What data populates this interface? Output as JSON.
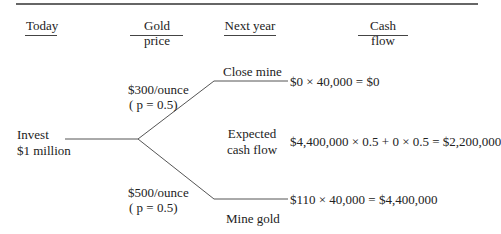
{
  "headers": {
    "today": "Today",
    "gold_price": "Gold price",
    "next_year": "Next year",
    "cash_flow": "Cash flow"
  },
  "root": {
    "line1": "Invest",
    "line2": "$1 million"
  },
  "branches": {
    "low": {
      "price": "$300/ounce",
      "prob": "( p = 0.5)",
      "decision": "Close mine",
      "cash_flow": "$0 × 40,000 = $0"
    },
    "high": {
      "price": "$500/ounce",
      "prob": "( p = 0.5)",
      "decision": "Mine gold",
      "cash_flow": "$110 × 40,000 = $4,400,000"
    }
  },
  "expected": {
    "line1": "Expected",
    "line2": "cash flow",
    "formula": "$4,400,000 × 0.5 + 0 × 0.5 = $2,200,000"
  },
  "colors": {
    "lines": "#555555",
    "text": "#222222"
  }
}
